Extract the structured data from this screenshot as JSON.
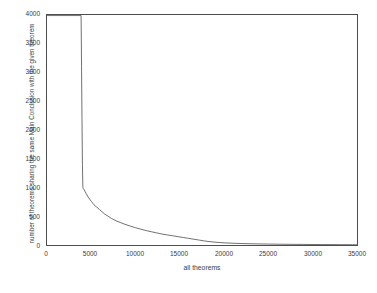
{
  "chart_data": {
    "type": "line",
    "title": "",
    "xlabel": "all theorems",
    "ylabel": "number of theorems sharing the same Main Conclusion with the given theorem",
    "xlim": [
      0,
      35000
    ],
    "ylim": [
      0,
      4000
    ],
    "xticks": [
      0,
      5000,
      10000,
      15000,
      20000,
      25000,
      30000,
      35000
    ],
    "yticks": [
      0,
      500,
      1000,
      1500,
      2000,
      2500,
      3000,
      3500,
      4000
    ],
    "xtick_labels": [
      "0",
      "5000",
      "10000",
      "15000",
      "20000",
      "25000",
      "30000",
      "35000"
    ],
    "ytick_labels": [
      "0",
      "500",
      "1000",
      "1500",
      "2000",
      "2500",
      "3000",
      "3500",
      "4000"
    ],
    "grid": false,
    "legend": null,
    "line_color": "#4d4d4d",
    "series": [
      {
        "name": "theorems sharing main conclusion",
        "x": [
          0,
          3850,
          3900,
          3950,
          4000,
          4050,
          4100,
          4200,
          4400,
          4700,
          5000,
          5300,
          5600,
          5900,
          6200,
          6500,
          6900,
          7300,
          7800,
          8300,
          8800,
          9400,
          10000,
          10600,
          11200,
          11800,
          12400,
          13000,
          13600,
          14200,
          14800,
          15400,
          16000,
          16600,
          17200,
          17800,
          18400,
          19200,
          20000,
          21000,
          22000,
          23500,
          25000,
          27000,
          29000,
          31000,
          33000,
          34500,
          35000
        ],
        "y": [
          3990,
          3990,
          3100,
          2200,
          1400,
          1000,
          980,
          960,
          900,
          820,
          760,
          700,
          660,
          620,
          580,
          540,
          500,
          460,
          420,
          390,
          360,
          330,
          300,
          275,
          250,
          230,
          210,
          190,
          175,
          160,
          145,
          130,
          115,
          100,
          85,
          70,
          58,
          46,
          38,
          30,
          25,
          20,
          16,
          12,
          10,
          8,
          6,
          5,
          4
        ]
      }
    ]
  },
  "axes": {
    "xlabel": "all theorems",
    "ylabel": "number of theorems sharing the same Main Conclusion with the given theorem"
  }
}
